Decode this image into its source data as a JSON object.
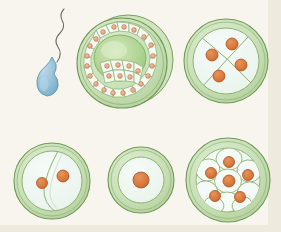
{
  "figure": {
    "background_color": "#f8f5ee",
    "panel_border_color": "#e9e4d6",
    "palette": {
      "zona_fill": "#c5dcb4",
      "zona_fill_light": "#d8e8c9",
      "zona_stroke": "#7aa05f",
      "cytoplasm_fill": "#f2f8f4",
      "cytoplasm_fill_light": "#eef6f0",
      "cell_stroke": "#8fb173",
      "nucleus_fill": "#d9763a",
      "nucleus_fill_light": "#e08b4e",
      "nucleus_stroke": "#a8522a",
      "blastocyst_cavity": "#a9cf8e",
      "blastocyst_cavity_light": "#cfe6b8",
      "small_nucleus_fill": "#e2a77f",
      "small_nucleus_stroke": "#b76a46",
      "sperm_fill": "#8fbcd4",
      "sperm_fill_light": "#b8d6e6",
      "sperm_stroke": "#5a8aa6",
      "sperm_tail_stroke": "#6b6b63"
    },
    "stages": [
      {
        "id": "sperm",
        "name": "sperm-cell",
        "label": "Sperm",
        "cx": 47,
        "cy": 82,
        "head_rx": 11,
        "head_ry": 15,
        "tail_length": 72
      },
      {
        "id": "blastocyst",
        "name": "blastocyst",
        "label": "Blastocyst",
        "cx": 122,
        "cy": 63,
        "r": 47,
        "outer_cell_count": 26,
        "has_cavity": true
      },
      {
        "id": "four-cell",
        "name": "four-cell-stage",
        "label": "Four-cell stage",
        "cx": 226,
        "cy": 61,
        "r": 42,
        "cell_count": 4,
        "nuclei": 4
      },
      {
        "id": "two-cell",
        "name": "two-cell-stage",
        "label": "Two-cell stage",
        "cx": 52,
        "cy": 181,
        "r": 38,
        "cell_count": 2,
        "nuclei": 2
      },
      {
        "id": "zygote",
        "name": "zygote",
        "label": "Zygote",
        "cx": 141,
        "cy": 180,
        "r": 33,
        "cell_count": 1,
        "nuclei": 1
      },
      {
        "id": "morula",
        "name": "morula",
        "label": "Morula",
        "cx": 228,
        "cy": 180,
        "r": 42,
        "cell_count": 9,
        "nuclei": 6
      }
    ],
    "four_cell_nuclei": [
      {
        "x": 212,
        "y": 55,
        "r": 6
      },
      {
        "x": 232,
        "y": 44,
        "r": 6
      },
      {
        "x": 241,
        "y": 65,
        "r": 6
      },
      {
        "x": 219,
        "y": 76,
        "r": 6
      }
    ],
    "two_cell_nuclei": [
      {
        "x": 42,
        "y": 183,
        "r": 5.5
      },
      {
        "x": 63,
        "y": 176,
        "r": 6
      }
    ],
    "zygote_nucleus": {
      "x": 141,
      "y": 180,
      "r": 8
    },
    "morula_nuclei": [
      {
        "x": 229,
        "y": 162,
        "r": 5.5
      },
      {
        "x": 211,
        "y": 173,
        "r": 5.5
      },
      {
        "x": 229,
        "y": 181,
        "r": 6
      },
      {
        "x": 248,
        "y": 175,
        "r": 5.5
      },
      {
        "x": 215,
        "y": 196,
        "r": 5.5
      },
      {
        "x": 240,
        "y": 197,
        "r": 5.5
      }
    ]
  }
}
